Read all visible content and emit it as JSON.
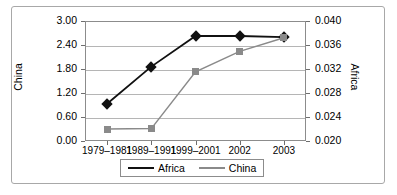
{
  "chart_data": {
    "type": "line",
    "title": "",
    "xlabel": "",
    "categories": [
      "1979–1981",
      "1989–1991",
      "1999–2001",
      "2002",
      "2003"
    ],
    "grid": true,
    "legend_position": "bottom",
    "axes": {
      "left": {
        "label": "China",
        "ticks": [
          "0.00",
          "0.60",
          "1.20",
          "1.80",
          "2.40",
          "3.00"
        ],
        "tick_values": [
          0.0,
          0.6,
          1.2,
          1.8,
          2.4,
          3.0
        ],
        "min": 0.0,
        "max": 3.0
      },
      "right": {
        "label": "Africa",
        "ticks": [
          "0.020",
          "0.024",
          "0.028",
          "0.032",
          "0.036",
          "0.040"
        ],
        "tick_values": [
          0.02,
          0.024,
          0.028,
          0.032,
          0.036,
          0.04
        ],
        "min": 0.02,
        "max": 0.04
      }
    },
    "series": [
      {
        "name": "Africa",
        "axis": "right",
        "color": "#111111",
        "marker": "diamond",
        "values": [
          0.0262,
          0.0324,
          0.0375,
          0.0375,
          0.0373
        ]
      },
      {
        "name": "China",
        "axis": "left",
        "color": "#8a8a8a",
        "marker": "square",
        "values": [
          0.3,
          0.31,
          1.73,
          2.24,
          2.58
        ]
      }
    ]
  },
  "legend": {
    "entries": [
      {
        "label": "Africa"
      },
      {
        "label": "China"
      }
    ]
  }
}
